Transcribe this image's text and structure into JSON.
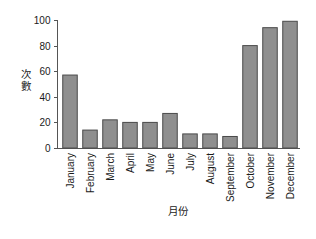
{
  "chart_data": {
    "type": "bar",
    "title": "",
    "xlabel": "月份",
    "ylabel": "次數",
    "ylim": [
      0,
      100
    ],
    "yticks": [
      0,
      20,
      40,
      60,
      80,
      100
    ],
    "grid": false,
    "legend": null,
    "categories": [
      "January",
      "February",
      "March",
      "April",
      "May",
      "June",
      "July",
      "August",
      "September",
      "October",
      "November",
      "December"
    ],
    "values": [
      57,
      14,
      22,
      20,
      20,
      27,
      11,
      11,
      9,
      80,
      94,
      99
    ],
    "bar_color": "#8f8f8f",
    "bar_edge_color": "#4a4a4a",
    "axis_color": "#555555",
    "background_color": "#ffffff"
  },
  "axis": {
    "y_tick_labels": [
      "0",
      "20",
      "40",
      "60",
      "80",
      "100"
    ],
    "y_title_chars": [
      "次",
      "數"
    ],
    "x_title": "月份"
  }
}
